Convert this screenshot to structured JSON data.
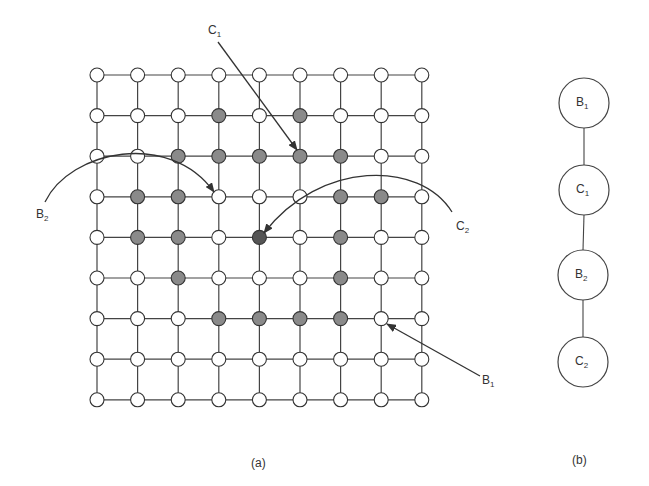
{
  "figure": {
    "panel_a": {
      "caption": "(a)",
      "grid": {
        "rows": 9,
        "cols": 9,
        "origin_x": 97,
        "origin_y": 75,
        "step_x": 40.6,
        "step_y": 40.6,
        "node_radius": 7,
        "states": [
          "wwwwwwwww",
          "wwwgwgwww",
          "wwgggggww",
          "wggwwwggw",
          "wggwdwgww",
          "wwgwwwgww",
          "wwwggggww",
          "wwwwwwwww",
          "wwwwwwwww"
        ]
      },
      "colors": {
        "white": "#ffffff",
        "gray": "#8a8a8a",
        "dark": "#555555",
        "line": "#444444"
      },
      "annotations": [
        {
          "id": "C1",
          "base": "C",
          "sub": "1",
          "x": 208,
          "y": 34
        },
        {
          "id": "B2",
          "base": "B",
          "sub": "2",
          "x": 36,
          "y": 218
        },
        {
          "id": "C2",
          "base": "C",
          "sub": "2",
          "x": 456,
          "y": 230
        },
        {
          "id": "B1",
          "base": "B",
          "sub": "1",
          "x": 482,
          "y": 384
        }
      ]
    },
    "panel_b": {
      "caption": "(b)",
      "nodes": [
        {
          "base": "B",
          "sub": "1",
          "cx": 584,
          "cy": 103
        },
        {
          "base": "C",
          "sub": "1",
          "cx": 584,
          "cy": 190
        },
        {
          "base": "B",
          "sub": "2",
          "cx": 583,
          "cy": 275
        },
        {
          "base": "C",
          "sub": "2",
          "cx": 583,
          "cy": 362
        }
      ],
      "radius": 25
    }
  }
}
